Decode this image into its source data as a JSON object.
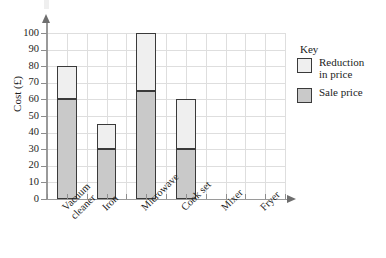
{
  "chart_data": {
    "type": "bar",
    "stacked": true,
    "title": "",
    "subtitle": "",
    "xlabel": "",
    "ylabel": "Cost (£)",
    "ylim": [
      0,
      100
    ],
    "ytick_step": 10,
    "yticks": [
      0,
      10,
      20,
      30,
      40,
      50,
      60,
      70,
      80,
      90,
      100
    ],
    "grid": true,
    "legend_position": "right",
    "legend_title": "Key",
    "categories": [
      "Vacuum cleaner",
      "Iron",
      "Microwave",
      "Cook set",
      "Mixer",
      "Fryer"
    ],
    "category_label_lines": [
      [
        "Vacuum",
        "cleaner"
      ],
      [
        "Iron"
      ],
      [
        "Microwave"
      ],
      [
        "Cook set"
      ],
      [
        "Mixer"
      ],
      [
        "Fryer"
      ]
    ],
    "series": [
      {
        "name": "Sale price",
        "color": "#c9c9c9",
        "values": [
          60,
          30,
          65,
          30,
          null,
          null
        ]
      },
      {
        "name": "Reduction in price",
        "color": "#efefef",
        "values": [
          20,
          15,
          35,
          30,
          null,
          null
        ]
      }
    ],
    "bar_totals": [
      80,
      45,
      100,
      60,
      null,
      null
    ]
  },
  "legend": {
    "title": "Key",
    "items": [
      {
        "label_line1": "Reduction",
        "label_line2": "in price",
        "swatch": "#efefef"
      },
      {
        "label_line1": "Sale price",
        "label_line2": "",
        "swatch": "#c9c9c9"
      }
    ]
  },
  "axes": {
    "y_title": "Cost (£)",
    "y_tick_labels": [
      "0",
      "10",
      "20",
      "30",
      "40",
      "50",
      "60",
      "70",
      "80",
      "90",
      "100"
    ],
    "x_tick_labels": [
      "Vacuum cleaner",
      "Iron",
      "Microwave",
      "Cook set",
      "Mixer",
      "Fryer"
    ]
  },
  "colors": {
    "sale_price": "#c9c9c9",
    "reduction_in_price": "#efefef",
    "bar_outline": "#3a3a3a",
    "grid": "#dedede",
    "axis": "#9a9a9a",
    "text": "#1c1c1c",
    "background": "#ffffff"
  }
}
